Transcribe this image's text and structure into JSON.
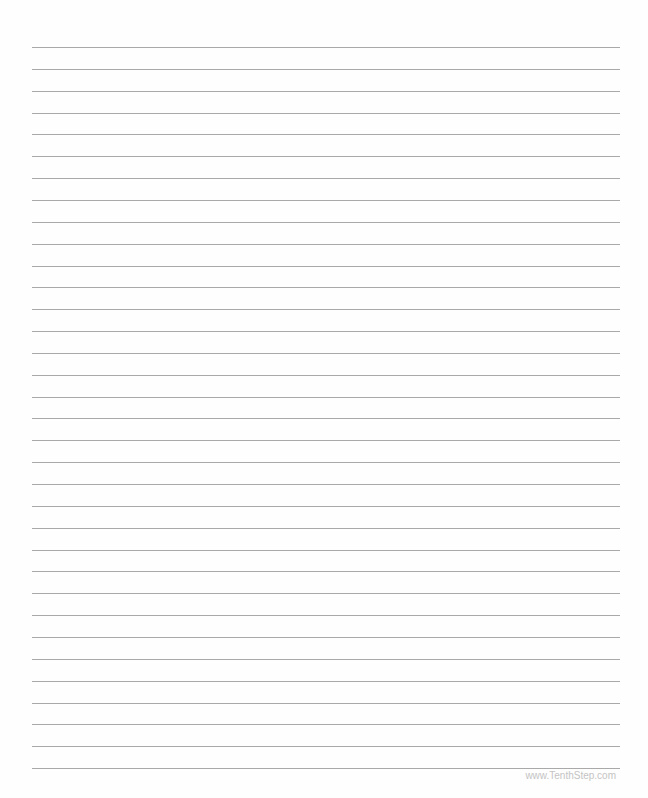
{
  "page": {
    "type": "lined-paper",
    "line_count": 34,
    "first_line_y": 47,
    "line_spacing": 21.85,
    "line_color": "#a9a9a9",
    "footer_text": "www.TenthStep.com"
  }
}
